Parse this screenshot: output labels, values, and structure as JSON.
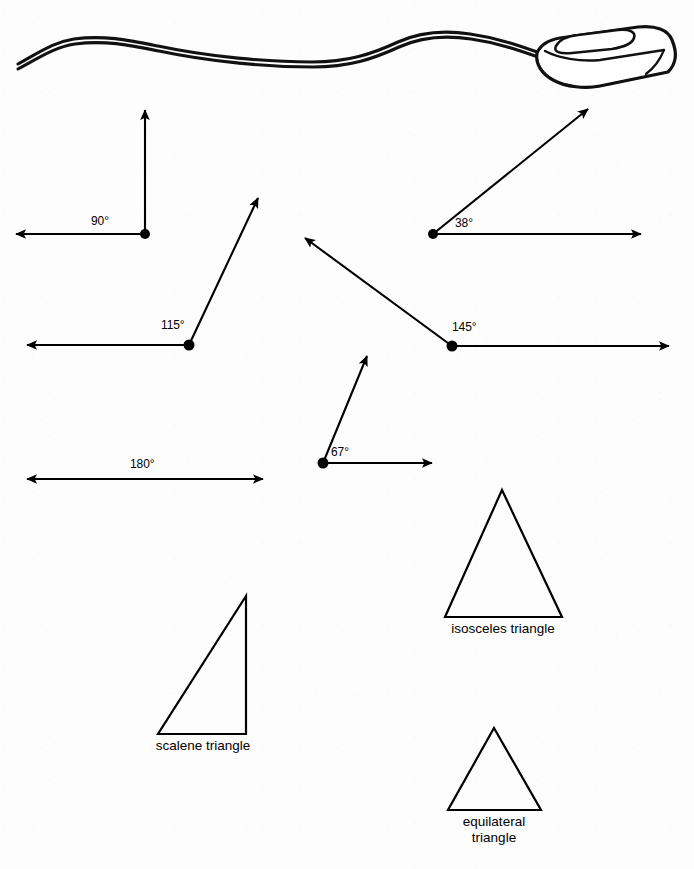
{
  "page": {
    "background_color": "#fdfdfd",
    "ink_color": "#000000",
    "width": 694,
    "height": 869
  },
  "illustration": {
    "name": "computer-mouse-with-cable",
    "description": "line drawing of a computer mouse with a long curving cable running to the left edge"
  },
  "angles": [
    {
      "id": "right-angle",
      "label": "90°",
      "degrees": 90,
      "type": "right",
      "vertex": [
        145,
        234
      ],
      "rays": [
        {
          "direction": "up",
          "tip": [
            145,
            105
          ]
        },
        {
          "direction": "left",
          "tip": [
            11,
            234
          ]
        }
      ],
      "label_pos": [
        99,
        215
      ]
    },
    {
      "id": "acute-angle-38",
      "label": "38°",
      "degrees": 38,
      "type": "acute",
      "vertex": [
        433,
        234
      ],
      "rays": [
        {
          "direction": "up-right",
          "tip": [
            592,
            105
          ]
        },
        {
          "direction": "right",
          "tip": [
            646,
            234
          ]
        }
      ],
      "label_pos": [
        455,
        217
      ]
    },
    {
      "id": "obtuse-angle-115",
      "label": "115°",
      "degrees": 115,
      "type": "obtuse",
      "vertex": [
        189,
        345
      ],
      "rays": [
        {
          "direction": "up-right",
          "tip": [
            261,
            193
          ]
        },
        {
          "direction": "left",
          "tip": [
            22,
            345
          ]
        }
      ],
      "label_pos": [
        161,
        319
      ]
    },
    {
      "id": "obtuse-angle-145",
      "label": "145°",
      "degrees": 145,
      "type": "obtuse",
      "vertex": [
        452,
        346
      ],
      "rays": [
        {
          "direction": "up-left",
          "tip": [
            300,
            234
          ]
        },
        {
          "direction": "right",
          "tip": [
            674,
            346
          ]
        }
      ],
      "label_pos": [
        452,
        321
      ]
    },
    {
      "id": "acute-angle-67",
      "label": "67°",
      "degrees": 67,
      "type": "acute",
      "vertex": [
        323,
        463
      ],
      "rays": [
        {
          "direction": "up-right",
          "tip": [
            370,
            351
          ]
        },
        {
          "direction": "right",
          "tip": [
            437,
            463
          ]
        }
      ],
      "label_pos": [
        331,
        446
      ]
    },
    {
      "id": "straight-angle-180",
      "label": "180°",
      "degrees": 180,
      "type": "straight",
      "vertex": null,
      "rays": [
        {
          "direction": "left",
          "tip": [
            22,
            479
          ]
        },
        {
          "direction": "right",
          "tip": [
            268,
            479
          ]
        }
      ],
      "label_pos": [
        130,
        458
      ]
    }
  ],
  "triangles": [
    {
      "id": "isosceles-triangle",
      "label": "isosceles triangle",
      "label_lines": [
        "isosceles triangle"
      ],
      "points": "502,490 562,617 445,617",
      "label_pos": [
        503,
        623
      ]
    },
    {
      "id": "scalene-triangle",
      "label": "scalene triangle",
      "label_lines": [
        "scalene triangle"
      ],
      "points": "246,596 246,734 158,734",
      "label_pos": [
        202,
        740
      ]
    },
    {
      "id": "equilateral-triangle",
      "label": "equilateral triangle",
      "label_lines": [
        "equilateral",
        "triangle"
      ],
      "label_line_1": "equilateral",
      "label_line_2": "triangle",
      "points": "494,728 541,810 448,810",
      "label_pos": [
        494,
        816
      ]
    }
  ]
}
